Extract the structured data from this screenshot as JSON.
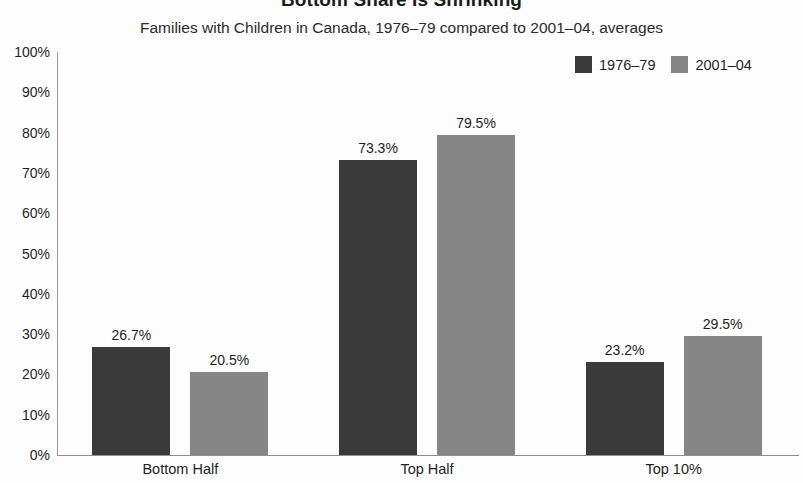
{
  "chart_data": {
    "type": "bar",
    "title": "Bottom Share Is Shrinking",
    "subtitle": "Families with Children in Canada, 1976–79 compared to 2001–04, averages",
    "xlabel": "",
    "ylabel": "",
    "ylim": [
      0,
      100
    ],
    "grid": false,
    "legend_position": "top-right",
    "categories": [
      "Bottom Half",
      "Top Half",
      "Top 10%"
    ],
    "series": [
      {
        "name": "1976–79",
        "color": "#3a3a3a",
        "values": [
          26.7,
          73.3,
          23.2
        ],
        "value_labels": [
          "26.7%",
          "73.3%",
          "23.2%"
        ]
      },
      {
        "name": "2001–04",
        "color": "#868686",
        "values": [
          20.5,
          79.5,
          29.5
        ],
        "value_labels": [
          "20.5%",
          "79.5%",
          "29.5%"
        ]
      }
    ],
    "y_ticks": [
      0,
      10,
      20,
      30,
      40,
      50,
      60,
      70,
      80,
      90,
      100
    ],
    "y_tick_labels": [
      "0%",
      "10%",
      "20%",
      "30%",
      "40%",
      "50%",
      "60%",
      "70%",
      "80%",
      "90%",
      "100%"
    ]
  }
}
